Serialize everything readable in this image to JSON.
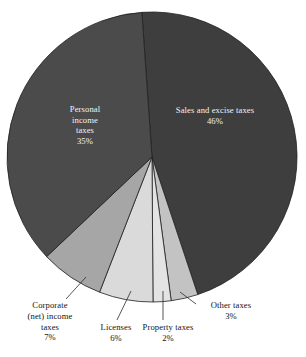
{
  "figure": {
    "background": "#ffffff",
    "label_text_color": "#141414",
    "inner_label_text_color": "#f2f2f2"
  },
  "chart_data": {
    "type": "pie",
    "title": "",
    "subtitle": "",
    "xlabel": "",
    "ylabel": "",
    "legend_position": "none",
    "grid": false,
    "units": "percent",
    "total": 99,
    "categories": [
      "Sales and excise taxes",
      "Other taxes",
      "Property taxes",
      "Licenses",
      "Corporate (net) income taxes",
      "Personal income taxes"
    ],
    "values": [
      46,
      3,
      2,
      6,
      7,
      35
    ],
    "slices": [
      {
        "name": "Sales and excise taxes",
        "value": 46,
        "value_label": "46%",
        "label_lines": [
          "Sales and excise taxes",
          "46%"
        ],
        "color": "#3e3e3e",
        "label_placement": "inside",
        "start_angle_deg": -4,
        "end_angle_deg": 161.6
      },
      {
        "name": "Other taxes",
        "value": 3,
        "value_label": "3%",
        "label_lines": [
          "Other taxes",
          "3%"
        ],
        "color": "#c3c3c3",
        "label_placement": "outside",
        "start_angle_deg": 161.6,
        "end_angle_deg": 172.4
      },
      {
        "name": "Property taxes",
        "value": 2,
        "value_label": "2%",
        "label_lines": [
          "Property taxes",
          "2%"
        ],
        "color": "#e3e3e3",
        "label_placement": "outside",
        "start_angle_deg": 172.4,
        "end_angle_deg": 179.6
      },
      {
        "name": "Licenses",
        "value": 6,
        "value_label": "6%",
        "label_lines": [
          "Licenses",
          "6%"
        ],
        "color": "#dadada",
        "label_placement": "outside",
        "start_angle_deg": 179.6,
        "end_angle_deg": 201.2
      },
      {
        "name": "Corporate (net) income taxes",
        "value": 7,
        "value_label": "7%",
        "label_lines": [
          "Corporate",
          "(net) income",
          "taxes",
          "7%"
        ],
        "color": "#a6a6a6",
        "label_placement": "outside",
        "start_angle_deg": 201.2,
        "end_angle_deg": 226.6
      },
      {
        "name": "Personal income taxes",
        "value": 35,
        "value_label": "35%",
        "label_lines": [
          "Personal",
          "income",
          "taxes",
          "35%"
        ],
        "color": "#4b4b4b",
        "label_placement": "inside",
        "start_angle_deg": 226.6,
        "end_angle_deg": 356
      }
    ]
  },
  "labels": {
    "sales": {
      "line1": "Sales and excise taxes",
      "line2": "46%"
    },
    "personal": {
      "line1": "Personal",
      "line2": "income",
      "line3": "taxes",
      "line4": "35%"
    },
    "corporate": {
      "line1": "Corporate",
      "line2": "(net) income",
      "line3": "taxes",
      "line4": "7%"
    },
    "licenses": {
      "line1": "Licenses",
      "line2": "6%"
    },
    "property": {
      "line1": "Property taxes",
      "line2": "2%"
    },
    "other": {
      "line1": "Other taxes",
      "line2": "3%"
    }
  }
}
